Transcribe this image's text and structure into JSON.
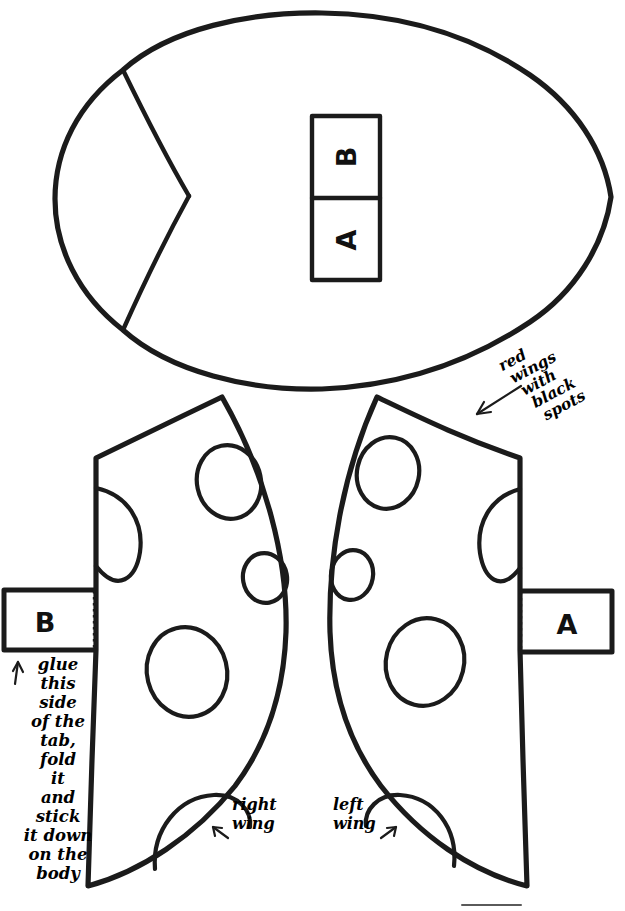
{
  "page": {
    "background_color": "#ffffff",
    "ink_color": "#1b1b1b",
    "width": 625,
    "height": 911
  },
  "body_piece": {
    "name": "ladybug-body",
    "slot_labels": {
      "top": "B",
      "bottom": "A"
    }
  },
  "tabs": [
    {
      "id": "tab-b",
      "label": "B",
      "side": "left"
    },
    {
      "id": "tab-a",
      "label": "A",
      "side": "right"
    }
  ],
  "wings": [
    {
      "id": "right-wing",
      "caption": "right\nwing",
      "caption_line1": "right",
      "caption_line2": "wing",
      "spots": 5
    },
    {
      "id": "left-wing",
      "caption": "left\nwing",
      "caption_line1": "left",
      "caption_line2": "wing",
      "spots": 5
    }
  ],
  "annotations": {
    "color_note": {
      "lines": [
        "red",
        "wings",
        "with",
        "black",
        "spots"
      ],
      "full_text": "red wings with black spots",
      "has_arrow": true
    },
    "glue_note": {
      "lines": [
        "glue",
        "this",
        "side",
        "of the",
        "tab,",
        "fold",
        "it",
        "and",
        "stick",
        "it down",
        "on the",
        "body"
      ],
      "full_text": "glue this side of the tab, fold it and stick it down on the body",
      "has_arrow": true,
      "arrow_glyph": "↑"
    },
    "wing_captions": {
      "right": {
        "line1": "right",
        "line2": "wing",
        "arrow_glyph": "↖"
      },
      "left": {
        "line1": "left",
        "line2": "wing",
        "arrow_glyph": "↗"
      }
    }
  }
}
